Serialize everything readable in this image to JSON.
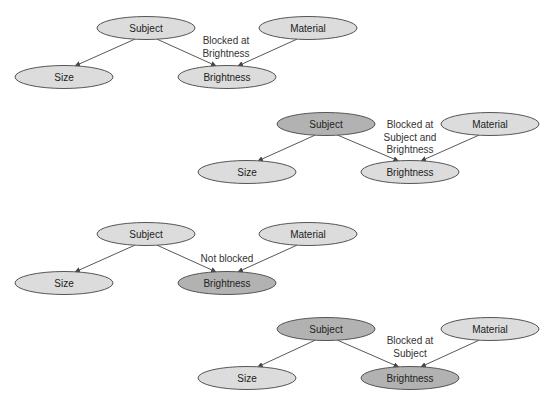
{
  "colors": {
    "light_fill": "#dcdcdc",
    "dark_fill": "#b2b2b2",
    "stroke": "#555555",
    "edge": "#444444"
  },
  "diagrams": [
    {
      "nodes": {
        "subject": {
          "label": "Subject",
          "cx": 146,
          "cy": 28,
          "shaded": false
        },
        "size": {
          "label": "Size",
          "cx": 64,
          "cy": 77,
          "shaded": false
        },
        "brightness": {
          "label": "Brightness",
          "cx": 227,
          "cy": 77,
          "shaded": false
        },
        "material": {
          "label": "Material",
          "cx": 308,
          "cy": 28,
          "shaded": false
        }
      },
      "annotation": [
        "Blocked at",
        "Brightness"
      ],
      "annotation_pos": {
        "x": 226,
        "y": 44
      }
    },
    {
      "nodes": {
        "subject": {
          "label": "Subject",
          "cx": 326,
          "cy": 124,
          "shaded": true
        },
        "size": {
          "label": "Size",
          "cx": 247,
          "cy": 172,
          "shaded": false
        },
        "brightness": {
          "label": "Brightness",
          "cx": 410,
          "cy": 172,
          "shaded": false
        },
        "material": {
          "label": "Material",
          "cx": 490,
          "cy": 124,
          "shaded": false
        }
      },
      "annotation": [
        "Blocked at",
        "Subject and",
        "Brightness"
      ],
      "annotation_pos": {
        "x": 410,
        "y": 128
      }
    },
    {
      "nodes": {
        "subject": {
          "label": "Subject",
          "cx": 146,
          "cy": 234,
          "shaded": false
        },
        "size": {
          "label": "Size",
          "cx": 64,
          "cy": 283,
          "shaded": false
        },
        "brightness": {
          "label": "Brightness",
          "cx": 227,
          "cy": 283,
          "shaded": true
        },
        "material": {
          "label": "Material",
          "cx": 308,
          "cy": 234,
          "shaded": false
        }
      },
      "annotation": [
        "Not blocked"
      ],
      "annotation_pos": {
        "x": 227,
        "y": 262
      }
    },
    {
      "nodes": {
        "subject": {
          "label": "Subject",
          "cx": 326,
          "cy": 329,
          "shaded": true
        },
        "size": {
          "label": "Size",
          "cx": 247,
          "cy": 378,
          "shaded": false
        },
        "brightness": {
          "label": "Brightness",
          "cx": 410,
          "cy": 378,
          "shaded": true
        },
        "material": {
          "label": "Material",
          "cx": 490,
          "cy": 329,
          "shaded": false
        }
      },
      "annotation": [
        "Blocked at",
        "Subject"
      ],
      "annotation_pos": {
        "x": 410,
        "y": 344
      }
    }
  ]
}
